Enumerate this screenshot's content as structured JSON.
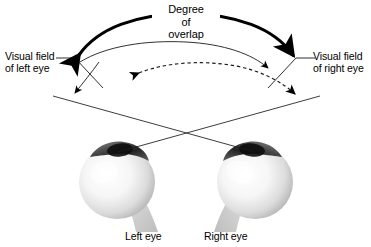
{
  "figure": {
    "title_lines": [
      "Degree",
      "of",
      "overlap"
    ],
    "labels": {
      "left_field_line1": "Visual field",
      "left_field_line2": "of left eye",
      "right_field_line1": "Visual field",
      "right_field_line2": "of right eye",
      "left_eye": "Left eye",
      "right_eye": "Right eye"
    },
    "colors": {
      "ink": "#000000",
      "background": "#ffffff",
      "sclera_light": "#fdfdfd",
      "sclera_mid": "#d8d8d8",
      "sclera_shadow": "#a9a9a9",
      "cornea_dark": "#1c1c1c",
      "optic_nerve": "#cfcfcf"
    }
  }
}
